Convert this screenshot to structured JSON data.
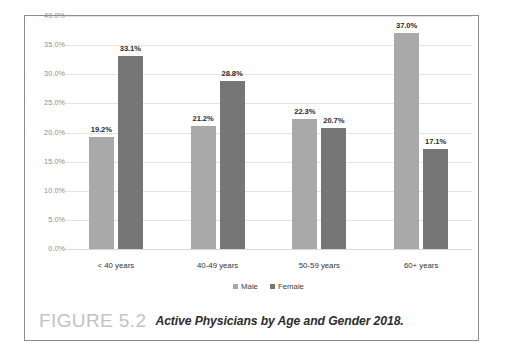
{
  "caption": {
    "figure_number": "FIGURE 5.2",
    "title": "Active Physicians by Age and Gender 2018."
  },
  "chart_data": {
    "type": "bar",
    "title": "Active Physicians by Age and Gender 2018.",
    "xlabel": "",
    "ylabel": "",
    "ylim": [
      0,
      40
    ],
    "grid": true,
    "legend_position": "bottom",
    "y_ticks": [
      "0.0%",
      "5.0%",
      "10.0%",
      "15.0%",
      "20.0%",
      "25.0%",
      "30.0%",
      "35.0%",
      "40.0%"
    ],
    "y_tick_values": [
      0,
      5,
      10,
      15,
      20,
      25,
      30,
      35,
      40
    ],
    "categories": [
      "< 40 years",
      "40-49 years",
      "50-59 years",
      "60+ years"
    ],
    "series": [
      {
        "name": "Male",
        "color": "#a9a9a9",
        "values": [
          19.2,
          21.2,
          22.3,
          37.0
        ],
        "labels": [
          "19.2%",
          "21.2%",
          "22.3%",
          "37.0%"
        ]
      },
      {
        "name": "Female",
        "color": "#767676",
        "values": [
          33.1,
          28.8,
          20.7,
          17.1
        ],
        "labels": [
          "33.1%",
          "28.8%",
          "20.7%",
          "17.1%"
        ]
      }
    ]
  },
  "colors": {
    "male_bar": "#a9a9a9",
    "female_bar": "#767676",
    "gridline": "#e4e4e4",
    "frame_border": "#8d8d8d",
    "axis_text": "#8c8c8c",
    "figure_number_text": "#c3c3c3",
    "background": "#ffffff"
  }
}
